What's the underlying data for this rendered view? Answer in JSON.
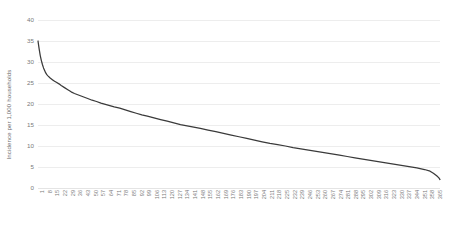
{
  "chart_data": {
    "type": "line",
    "title": "",
    "xlabel": "",
    "ylabel": "Incidence per 1,000 households",
    "ylim": [
      0,
      40
    ],
    "ytick_values": [
      0,
      5,
      10,
      15,
      20,
      25,
      30,
      35,
      40
    ],
    "ytick_labels": [
      "0",
      "5",
      "10",
      "15",
      "20",
      "25",
      "30",
      "35",
      "40"
    ],
    "xlim": [
      1,
      365
    ],
    "xtick_labels": [
      "1",
      "8",
      "15",
      "22",
      "29",
      "36",
      "43",
      "50",
      "57",
      "64",
      "71",
      "78",
      "85",
      "92",
      "99",
      "106",
      "113",
      "120",
      "127",
      "134",
      "141",
      "148",
      "155",
      "162",
      "169",
      "176",
      "183",
      "190",
      "197",
      "204",
      "211",
      "218",
      "225",
      "232",
      "239",
      "246",
      "253",
      "260",
      "267",
      "274",
      "281",
      "288",
      "295",
      "302",
      "309",
      "316",
      "323",
      "330",
      "337",
      "344",
      "351",
      "358",
      "365"
    ],
    "grid": true,
    "gridlines": "horizontal",
    "legend": "none",
    "line_color": "#3a3a3a",
    "grid_color": "#ededed",
    "background_color": "#ffffff",
    "series": [
      {
        "name": "Incidence per 1,000 households",
        "x": [
          1,
          2,
          3,
          4,
          5,
          6,
          7,
          8,
          9,
          10,
          12,
          14,
          16,
          18,
          20,
          22,
          25,
          28,
          31,
          34,
          37,
          40,
          43,
          46,
          50,
          54,
          58,
          62,
          66,
          70,
          75,
          80,
          85,
          90,
          95,
          100,
          106,
          112,
          118,
          124,
          130,
          136,
          142,
          148,
          155,
          162,
          169,
          176,
          183,
          190,
          197,
          204,
          211,
          218,
          225,
          232,
          239,
          246,
          253,
          260,
          267,
          274,
          281,
          288,
          295,
          302,
          309,
          316,
          323,
          330,
          337,
          344,
          351,
          356,
          359,
          362,
          364,
          365
        ],
        "values": [
          35.0,
          33.2,
          31.6,
          30.4,
          29.4,
          28.6,
          28.0,
          27.4,
          27.0,
          26.7,
          26.2,
          25.8,
          25.4,
          25.1,
          24.8,
          24.4,
          23.9,
          23.4,
          22.9,
          22.5,
          22.2,
          21.9,
          21.6,
          21.3,
          20.9,
          20.6,
          20.2,
          19.9,
          19.6,
          19.3,
          19.0,
          18.6,
          18.2,
          17.8,
          17.4,
          17.1,
          16.7,
          16.3,
          15.9,
          15.5,
          15.1,
          14.8,
          14.5,
          14.2,
          13.8,
          13.4,
          13.0,
          12.6,
          12.2,
          11.8,
          11.4,
          11.0,
          10.6,
          10.3,
          10.0,
          9.6,
          9.3,
          9.0,
          8.7,
          8.4,
          8.1,
          7.8,
          7.5,
          7.2,
          6.9,
          6.6,
          6.3,
          6.0,
          5.7,
          5.4,
          5.1,
          4.8,
          4.4,
          4.0,
          3.5,
          2.9,
          2.4,
          2.0
        ]
      }
    ]
  }
}
